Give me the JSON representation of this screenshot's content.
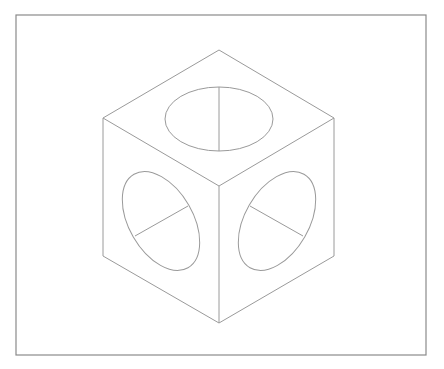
{
  "figure": {
    "background": "#ffffff",
    "frame": {
      "x": 16,
      "y": 15,
      "width": 410,
      "height": 340,
      "stroke": "#8a8a8a",
      "stroke_width": 1.2
    },
    "line_color": "#9a9a9a",
    "line_width": 1,
    "cube": {
      "vertices": {
        "top": [
          219,
          50
        ],
        "left": [
          103,
          118
        ],
        "right": [
          334,
          118
        ],
        "center": [
          219,
          186
        ],
        "bottom_left": [
          103,
          256
        ],
        "bottom_right": [
          334,
          256
        ],
        "bottom": [
          219,
          323
        ]
      },
      "faces": [
        "top",
        "left",
        "right"
      ]
    },
    "circles": [
      {
        "face": "top",
        "cx": 219,
        "cy": 119,
        "rx": 54,
        "ry": 32,
        "rotation": 0,
        "radius_line": [
          [
            219,
            87
          ],
          [
            219,
            151
          ]
        ]
      },
      {
        "face": "left",
        "cx": 161,
        "cy": 221,
        "rx": 54,
        "ry": 32,
        "rotation": 60,
        "radius_line": [
          [
            135,
            236
          ],
          [
            188,
            206
          ]
        ]
      },
      {
        "face": "right",
        "cx": 277,
        "cy": 221,
        "rx": 54,
        "ry": 32,
        "rotation": -60,
        "radius_line": [
          [
            250,
            206
          ],
          [
            303,
            236
          ]
        ]
      }
    ]
  }
}
